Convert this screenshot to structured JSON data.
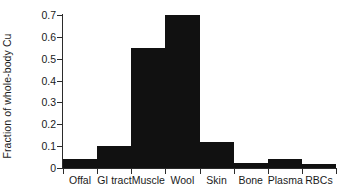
{
  "chart_data": {
    "type": "bar",
    "title": "",
    "subtitle": "",
    "xlabel": "",
    "ylabel": "Fraction of whole-body Cu",
    "categories": [
      "Offal",
      "GI tract",
      "Muscle",
      "Wool",
      "Skin",
      "Bone",
      "Plasma",
      "RBCs"
    ],
    "values": [
      0.04,
      0.1,
      0.55,
      0.7,
      0.12,
      0.025,
      0.04,
      0.02
    ],
    "ylim": [
      0,
      0.7
    ],
    "xlim": [
      0,
      8
    ],
    "ytick_values": [
      0,
      0.1,
      0.2,
      0.3,
      0.4,
      0.5,
      0.6,
      0.7
    ],
    "ytick_labels": [
      "0",
      "0.1",
      "0.2",
      "0.3",
      "0.4",
      "0.5",
      "0.6",
      "0.7"
    ],
    "grid": false,
    "legend": false,
    "legend_position": "none",
    "bar_style": "contiguous-histogram",
    "bar_color": "#111111",
    "axis_color": "#2b2b2b",
    "text_color": "#1a1a1a",
    "background_color": "#ffffff"
  }
}
